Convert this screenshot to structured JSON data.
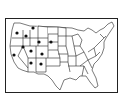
{
  "map": {
    "title": "United States map with marked western states",
    "outline_color": "#222222",
    "marker_color": "#111111",
    "background_color": "#ffffff",
    "marked_states": [
      {
        "name": "Washington",
        "x": 17,
        "y": 33
      },
      {
        "name": "Oregon",
        "x": 14,
        "y": 43
      },
      {
        "name": "Idaho",
        "x": 26,
        "y": 36
      },
      {
        "name": "Montana",
        "x": 33,
        "y": 28
      },
      {
        "name": "Wyoming",
        "x": 40,
        "y": 42
      },
      {
        "name": "California",
        "x": 14,
        "y": 55
      },
      {
        "name": "Nevada",
        "x": 23,
        "y": 48
      },
      {
        "name": "Utah",
        "x": 31,
        "y": 51
      },
      {
        "name": "Colorado",
        "x": 42,
        "y": 54
      },
      {
        "name": "Arizona",
        "x": 31,
        "y": 63
      },
      {
        "name": "New Mexico",
        "x": 41,
        "y": 64
      },
      {
        "name": "South Dakota",
        "x": 51,
        "y": 42
      }
    ]
  }
}
